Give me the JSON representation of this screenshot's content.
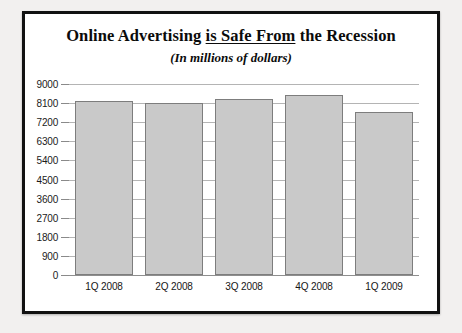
{
  "card": {
    "title_part1": "Online Advertising ",
    "title_underlined": "is Safe From",
    "title_part2": " the Recession",
    "subtitle": "(In millions of dollars)"
  },
  "colors": {
    "frame": "#111111",
    "card_background": "#ffffff",
    "page_background": "#f2f0ef",
    "bar_fill": "#c9c9c9",
    "bar_border": "#7d7d7d",
    "gridline": "#b4b4b4",
    "text": "#0b0b0b"
  },
  "chart_data": {
    "type": "bar",
    "title": "Online Advertising is Safe From the Recession",
    "subtitle": "(In millions of dollars)",
    "xlabel": "",
    "ylabel": "",
    "categories": [
      "1Q 2008",
      "2Q 2008",
      "3Q 2008",
      "4Q 2008",
      "1Q 2009"
    ],
    "values": [
      8200,
      8100,
      8300,
      8500,
      7700
    ],
    "ylim": [
      0,
      9000
    ],
    "yticks": [
      0,
      900,
      1800,
      2700,
      3600,
      4500,
      5400,
      6300,
      7200,
      8100,
      9000
    ],
    "ytick_labels": [
      "0",
      "900",
      "1800",
      "2700",
      "3600",
      "4500",
      "5400",
      "6300",
      "7200",
      "8100",
      "9000"
    ],
    "grid": true,
    "legend": null,
    "legend_position": "none"
  }
}
